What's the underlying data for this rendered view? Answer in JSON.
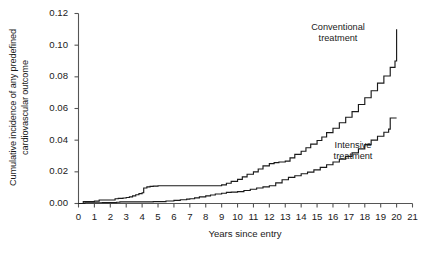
{
  "chart_data": {
    "type": "line",
    "subtype": "kaplan-meier-cumulative-incidence-step",
    "title": "",
    "xlabel": "Years since entry",
    "ylabel_line1": "Cumulative incidence of any predefined",
    "ylabel_line2": "cardiovascular outcome",
    "xlim": [
      0,
      21
    ],
    "ylim": [
      0,
      0.12
    ],
    "xticks": [
      "0",
      "1",
      "2",
      "3",
      "4",
      "5",
      "6",
      "7",
      "8",
      "9",
      "10",
      "11",
      "12",
      "13",
      "14",
      "15",
      "16",
      "17",
      "18",
      "19",
      "20",
      "21"
    ],
    "yticks": [
      "0.00",
      "0.02",
      "0.04",
      "0.06",
      "0.08",
      "0.10",
      "0.12"
    ],
    "ytick_values": [
      0.0,
      0.02,
      0.04,
      0.06,
      0.08,
      0.1,
      0.12
    ],
    "grid": false,
    "legend_position": "inline-annotations",
    "line_color": "#1a1a1a",
    "axis_color": "#555555",
    "series": [
      {
        "name": "Conventional treatment",
        "label_line1": "Conventional",
        "label_line2": "treatment",
        "final_value": 0.11,
        "x": [
          0.0,
          0.3,
          0.5,
          1.0,
          1.3,
          2.0,
          2.3,
          2.5,
          2.8,
          3.0,
          3.2,
          3.4,
          3.6,
          3.8,
          4.0,
          4.1,
          4.3,
          4.5,
          4.7,
          5.0,
          6.0,
          7.0,
          8.0,
          8.6,
          9.0,
          9.3,
          9.6,
          10.0,
          10.3,
          10.6,
          11.0,
          11.3,
          11.6,
          12.0,
          12.3,
          12.6,
          13.0,
          13.3,
          13.6,
          14.0,
          14.3,
          14.6,
          15.0,
          15.3,
          15.6,
          16.0,
          16.4,
          16.8,
          17.2,
          17.6,
          18.0,
          18.4,
          18.8,
          19.2,
          19.6,
          19.9,
          20.0
        ],
        "y": [
          0.0,
          0.0012,
          0.0012,
          0.0015,
          0.0022,
          0.0022,
          0.003,
          0.0032,
          0.0035,
          0.0038,
          0.0042,
          0.0048,
          0.0055,
          0.0062,
          0.0068,
          0.0098,
          0.0105,
          0.0108,
          0.011,
          0.0112,
          0.0112,
          0.0112,
          0.0112,
          0.0112,
          0.0118,
          0.0128,
          0.014,
          0.0152,
          0.0168,
          0.0185,
          0.02,
          0.0218,
          0.0238,
          0.0252,
          0.0258,
          0.0262,
          0.0268,
          0.0288,
          0.031,
          0.033,
          0.0352,
          0.0375,
          0.0398,
          0.042,
          0.0448,
          0.0475,
          0.051,
          0.0545,
          0.058,
          0.0625,
          0.0668,
          0.0712,
          0.076,
          0.0805,
          0.086,
          0.09,
          0.11
        ]
      },
      {
        "name": "Intensive treatment",
        "label_line1": "Intensive",
        "label_line2": "treatment",
        "final_value": 0.054,
        "x": [
          0.0,
          0.4,
          1.0,
          1.5,
          2.0,
          2.4,
          2.6,
          3.0,
          3.5,
          4.0,
          4.5,
          4.7,
          5.0,
          5.5,
          6.0,
          6.4,
          6.8,
          7.0,
          7.3,
          7.6,
          8.0,
          8.3,
          8.6,
          9.0,
          9.3,
          9.6,
          10.0,
          10.4,
          10.8,
          11.2,
          11.6,
          12.0,
          12.4,
          12.8,
          13.2,
          13.6,
          14.0,
          14.4,
          14.8,
          15.2,
          15.6,
          16.0,
          16.4,
          16.8,
          17.2,
          17.6,
          18.0,
          18.4,
          18.8,
          19.2,
          19.5,
          19.6,
          20.0
        ],
        "y": [
          0.0,
          0.0005,
          0.0005,
          0.0006,
          0.0006,
          0.0008,
          0.001,
          0.001,
          0.001,
          0.001,
          0.001,
          0.0012,
          0.0012,
          0.0016,
          0.002,
          0.0024,
          0.0028,
          0.003,
          0.0036,
          0.0042,
          0.0048,
          0.0054,
          0.006,
          0.0065,
          0.007,
          0.0072,
          0.0075,
          0.0082,
          0.009,
          0.0098,
          0.0105,
          0.0112,
          0.013,
          0.015,
          0.0165,
          0.0175,
          0.0188,
          0.0198,
          0.0212,
          0.0228,
          0.0245,
          0.0262,
          0.028,
          0.0298,
          0.032,
          0.0345,
          0.0372,
          0.04,
          0.0425,
          0.045,
          0.047,
          0.054,
          0.054
        ]
      }
    ]
  },
  "annotations": {
    "conventional": {
      "line1": "Conventional",
      "line2": "treatment"
    },
    "intensive": {
      "line1": "Intensive",
      "line2": "treatment"
    }
  }
}
